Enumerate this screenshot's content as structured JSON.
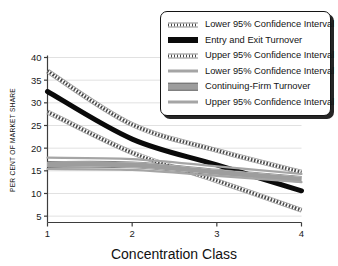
{
  "chart_data": {
    "type": "line",
    "title": "",
    "xlabel": "Concentration Class",
    "ylabel": "PER CENT OF MARKET SHARE",
    "x": [
      1,
      2,
      3,
      4
    ],
    "xticklabels": [
      "1",
      "2",
      "3",
      "4"
    ],
    "yticklabels": [
      "5",
      "10",
      "15",
      "20",
      "25",
      "30",
      "35",
      "40"
    ],
    "yticks": [
      5,
      10,
      15,
      20,
      25,
      30,
      35,
      40
    ],
    "xlim": [
      1,
      4
    ],
    "ylim": [
      3.6,
      40
    ],
    "grid": "horizontal",
    "legend_position": "top-right",
    "series": [
      {
        "name": "Lower 95% Confidence Interval",
        "group": "entry-exit",
        "style": "dotted",
        "color": "#4a4a4a",
        "values": [
          37.0,
          25.2,
          19.5,
          14.7
        ]
      },
      {
        "name": "Entry and Exit Turnover",
        "group": "entry-exit",
        "style": "thick-solid",
        "color": "#0a0a0a",
        "values": [
          32.5,
          22.0,
          16.3,
          10.6
        ]
      },
      {
        "name": "Upper 95% Confidence Interval",
        "group": "entry-exit",
        "style": "dotted",
        "color": "#4a4a4a",
        "values": [
          28.0,
          19.0,
          12.8,
          6.3
        ]
      },
      {
        "name": "Lower 95% Confidence Interval",
        "group": "continuing-firm",
        "style": "gray-thin",
        "color": "#a5a5a5",
        "values": [
          17.9,
          17.6,
          16.0,
          14.3
        ]
      },
      {
        "name": "Continuing-Firm Turnover",
        "group": "continuing-firm",
        "style": "gray-thick",
        "color": "#9d9d9d",
        "values": [
          16.4,
          16.3,
          14.7,
          13.1
        ]
      },
      {
        "name": "Upper 95% Confidence Interval",
        "group": "continuing-firm",
        "style": "gray-thin",
        "color": "#a5a5a5",
        "values": [
          15.4,
          15.2,
          13.9,
          12.5
        ]
      }
    ]
  },
  "legend": {
    "items": [
      {
        "label": "Lower 95% Confidence Interval",
        "swatch": "sw-dotted-dark"
      },
      {
        "label": "Entry and Exit Turnover",
        "swatch": "sw-thick-black"
      },
      {
        "label": "Upper 95% Confidence Interval",
        "swatch": "sw-dotted-dark"
      },
      {
        "label": "Lower 95% Confidence Interval",
        "swatch": "sw-gray-thin"
      },
      {
        "label": "Continuing-Firm Turnover",
        "swatch": "sw-gray-thick"
      },
      {
        "label": "Upper 95% Confidence Interval",
        "swatch": "sw-gray-thin"
      }
    ]
  },
  "colors": {
    "axis": "#3d3d3d",
    "grid": "#dedede",
    "background": "#ffffff",
    "entry_exit_line": "#0a0a0a",
    "entry_exit_ci": "#4a4a4a",
    "continuing_line": "#9d9d9d",
    "continuing_ci": "#a5a5a5",
    "legend_border": "#141414"
  }
}
